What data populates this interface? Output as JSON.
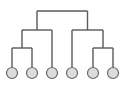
{
  "diagram": {
    "type": "dendrogram",
    "leaves": [
      "leaf-1",
      "leaf-2",
      "leaf-3",
      "leaf-4",
      "leaf-5",
      "leaf-6"
    ],
    "tree": {
      "children": [
        {
          "children": [
            {
              "children": [
                0,
                1
              ]
            },
            2
          ]
        },
        {
          "children": [
            3,
            {
              "children": [
                4,
                5
              ]
            }
          ]
        }
      ]
    },
    "colors": {
      "link": "#5a5a5a",
      "leaf_fill": "#dcdcdc",
      "leaf_stroke": "#6a6a6a"
    }
  }
}
